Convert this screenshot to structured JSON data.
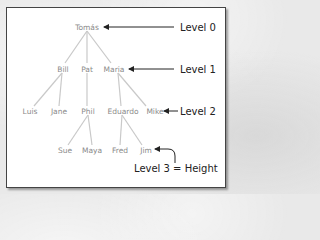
{
  "diagram": {
    "type": "tree",
    "nodes": [
      {
        "id": "tomas",
        "label": "Tomás",
        "level": 0,
        "x": 87,
        "y": 28
      },
      {
        "id": "bill",
        "label": "Bill",
        "level": 1,
        "x": 61,
        "y": 70
      },
      {
        "id": "pat",
        "label": "Pat",
        "level": 1,
        "x": 87,
        "y": 70
      },
      {
        "id": "maria",
        "label": "Maria",
        "level": 1,
        "x": 113,
        "y": 70
      },
      {
        "id": "luis",
        "label": "Luis",
        "level": 2,
        "x": 29,
        "y": 112
      },
      {
        "id": "jane",
        "label": "Jane",
        "level": 2,
        "x": 58,
        "y": 112
      },
      {
        "id": "phil",
        "label": "Phil",
        "level": 2,
        "x": 88,
        "y": 112
      },
      {
        "id": "eduardo",
        "label": "Eduardo",
        "level": 2,
        "x": 122,
        "y": 112
      },
      {
        "id": "mike",
        "label": "Mike",
        "level": 2,
        "x": 153,
        "y": 112
      },
      {
        "id": "sue",
        "label": "Sue",
        "level": 3,
        "x": 63,
        "y": 151
      },
      {
        "id": "maya",
        "label": "Maya",
        "level": 3,
        "x": 91,
        "y": 151
      },
      {
        "id": "fred",
        "label": "Fred",
        "level": 3,
        "x": 119,
        "y": 151
      },
      {
        "id": "jim",
        "label": "Jim",
        "level": 3,
        "x": 146,
        "y": 151
      }
    ],
    "edges": [
      [
        "tomas",
        "bill"
      ],
      [
        "tomas",
        "pat"
      ],
      [
        "tomas",
        "maria"
      ],
      [
        "bill",
        "luis"
      ],
      [
        "bill",
        "jane"
      ],
      [
        "pat",
        "phil"
      ],
      [
        "maria",
        "eduardo"
      ],
      [
        "maria",
        "mike"
      ],
      [
        "phil",
        "sue"
      ],
      [
        "phil",
        "maya"
      ],
      [
        "eduardo",
        "fred"
      ],
      [
        "eduardo",
        "jim"
      ]
    ],
    "annotations": [
      {
        "label": "Level 0",
        "points_to": "tomas"
      },
      {
        "label": "Level 1",
        "points_to": "maria"
      },
      {
        "label": "Level 2",
        "points_to": "mike"
      },
      {
        "label": "Level 3 = Height",
        "points_to": "jim"
      }
    ]
  },
  "labels": {
    "level0": "Level 0",
    "level1": "Level 1",
    "level2": "Level 2",
    "level3": "Level 3 = Height"
  },
  "nodes": {
    "tomas": "Tomás",
    "bill": "Bill",
    "pat": "Pat",
    "maria": "Maria",
    "luis": "Luis",
    "jane": "Jane",
    "phil": "Phil",
    "eduardo": "Eduardo",
    "mike": "Mike",
    "sue": "Sue",
    "maya": "Maya",
    "fred": "Fred",
    "jim": "Jim"
  }
}
